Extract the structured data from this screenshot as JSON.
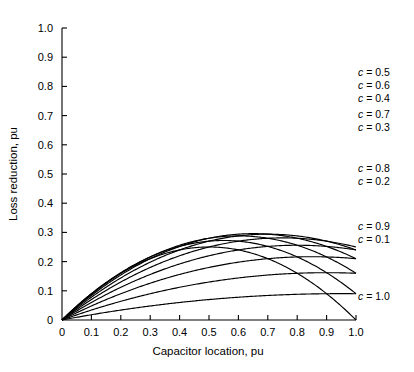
{
  "chart_data": {
    "type": "line",
    "title": "",
    "xlabel": "Capacitor location, pu",
    "ylabel": "Loss reduction, pu",
    "xlim": [
      0,
      1.0
    ],
    "ylim": [
      0,
      1.0
    ],
    "grid": false,
    "legend_position": "right-inline",
    "xticks": [
      "0",
      "0.1",
      "0.2",
      "0.3",
      "0.4",
      "0.5",
      "0.6",
      "0.7",
      "0.8",
      "0.9",
      "1.0"
    ],
    "xtick_values": [
      0,
      0.1,
      0.2,
      0.3,
      0.4,
      0.5,
      0.6,
      0.7,
      0.8,
      0.9,
      1.0
    ],
    "yticks": [
      "0",
      "0.1",
      "0.2",
      "0.3",
      "0.4",
      "0.5",
      "0.6",
      "0.7",
      "0.8",
      "0.9",
      "1.0"
    ],
    "ytick_values": [
      0,
      0.1,
      0.2,
      0.3,
      0.4,
      0.5,
      0.6,
      0.7,
      0.8,
      0.9,
      1.0
    ],
    "formula": "f(x) = c(2x - x^2) - c^2 x",
    "x": [
      0,
      0.05,
      0.1,
      0.15,
      0.2,
      0.25,
      0.3,
      0.35,
      0.4,
      0.45,
      0.5,
      0.55,
      0.6,
      0.65,
      0.7,
      0.75,
      0.8,
      0.85,
      0.9,
      0.95,
      1.0
    ],
    "series": [
      {
        "name": "c = 0.1",
        "c": 0.1,
        "peak_x": 0.95,
        "peak_y": 0.1,
        "end_y": 0.09,
        "values": [
          0,
          0.0094,
          0.0185,
          0.0273,
          0.0357,
          0.0438,
          0.0515,
          0.0589,
          0.066,
          0.0727,
          0.079,
          0.085,
          0.0906,
          0.0959,
          0.1008,
          0.1054,
          0.1096,
          0.1134,
          0.1169,
          0.1201,
          0.1229
        ]
      },
      {
        "name": "c = 0.2",
        "c": 0.2,
        "peak_x": 0.9,
        "peak_y": 0.2,
        "end_y": 0.16,
        "values": [
          0,
          0.0175,
          0.0345,
          0.051,
          0.067,
          0.0825,
          0.0975,
          0.112,
          0.126,
          0.1395,
          0.1525,
          0.165,
          0.177,
          0.1885,
          0.1995,
          0.21,
          0.22,
          0.2295,
          0.2385,
          0.247,
          0.255
        ]
      },
      {
        "name": "c = 0.3",
        "c": 0.3,
        "peak_x": 0.85,
        "peak_y": 0.3,
        "end_y": 0.21,
        "values": [
          0,
          0.0248,
          0.0489,
          0.0723,
          0.095,
          0.117,
          0.1383,
          0.1589,
          0.1788,
          0.198,
          0.2165,
          0.2343,
          0.2514,
          0.2678,
          0.2835,
          0.2985,
          0.3128,
          0.3264,
          0.3393,
          0.3515,
          0.363
        ]
      },
      {
        "name": "c = 0.4",
        "c": 0.4,
        "peak_x": 0.8,
        "peak_y": 0.4,
        "end_y": 0.24,
        "values": [
          0,
          0.0312,
          0.0616,
          0.0912,
          0.12,
          0.148,
          0.1752,
          0.2016,
          0.2272,
          0.252,
          0.276,
          0.2992,
          0.3216,
          0.3432,
          0.364,
          0.384,
          0.4032,
          0.4216,
          0.4392,
          0.456,
          0.472
        ]
      },
      {
        "name": "c = 0.5",
        "c": 0.5,
        "peak_x": 0.75,
        "peak_y": 0.5,
        "end_y": 0.25,
        "values": [
          0,
          0.0369,
          0.0725,
          0.1069,
          0.14,
          0.1719,
          0.2025,
          0.2319,
          0.26,
          0.2869,
          0.3125,
          0.3369,
          0.36,
          0.3819,
          0.4025,
          0.4219,
          0.44,
          0.4569,
          0.4725,
          0.4869,
          0.5
        ]
      },
      {
        "name": "c = 0.6",
        "c": 0.6,
        "peak_x": 0.7,
        "peak_y": 0.6,
        "end_y": 0.24,
        "values": [
          0,
          0.0417,
          0.0816,
          0.1197,
          0.156,
          0.1905,
          0.2232,
          0.2541,
          0.2832,
          0.3105,
          0.336,
          0.3597,
          0.3816,
          0.4017,
          0.42,
          0.4365,
          0.4512,
          0.4641,
          0.4752,
          0.4845,
          0.492
        ]
      },
      {
        "name": "c = 0.7",
        "c": 0.7,
        "peak_x": 0.65,
        "peak_y": 0.7,
        "end_y": 0.21,
        "values": [
          0,
          0.0456,
          0.0889,
          0.1298,
          0.168,
          0.2039,
          0.2373,
          0.2683,
          0.2968,
          0.3229,
          0.3465,
          0.3678,
          0.3866,
          0.403,
          0.417,
          0.4285,
          0.4376,
          0.4443,
          0.4486,
          0.4504,
          0.45
        ]
      },
      {
        "name": "c = 0.8",
        "c": 0.8,
        "peak_x": 0.6,
        "peak_y": 0.8,
        "end_y": 0.16,
        "values": [
          0,
          0.0484,
          0.0936,
          0.1356,
          0.176,
          0.212,
          0.2448,
          0.2744,
          0.3008,
          0.324,
          0.344,
          0.3608,
          0.3744,
          0.3848,
          0.392,
          0.396,
          0.3968,
          0.3944,
          0.3888,
          0.38,
          0.368
        ]
      },
      {
        "name": "c = 0.9",
        "c": 0.9,
        "peak_x": 0.55,
        "peak_y": 0.9,
        "end_y": 0.09,
        "values": [
          0,
          0.0473,
          0.0929,
          0.1337,
          0.172,
          0.2059,
          0.2363,
          0.2631,
          0.2864,
          0.3061,
          0.3225,
          0.3353,
          0.3446,
          0.3504,
          0.3528,
          0.3516,
          0.3469,
          0.3386,
          0.3269,
          0.3116,
          0.293
        ]
      },
      {
        "name": "c = 1.0",
        "c": 1.0,
        "peak_x": 0.5,
        "peak_y": 1.0,
        "end_y": 0.0,
        "values": [
          0,
          0.0475,
          0.09,
          0.1275,
          0.16,
          0.1875,
          0.21,
          0.2275,
          0.24,
          0.2475,
          0.25,
          0.2475,
          0.24,
          0.2275,
          0.21,
          0.1875,
          0.16,
          0.1275,
          0.09,
          0.0475,
          0.0
        ]
      }
    ],
    "annotations": [
      {
        "text": "c = 0.5",
        "c": 0.5,
        "x_px": 358,
        "y_px": 76
      },
      {
        "text": "c = 0.6",
        "c": 0.6,
        "x_px": 358,
        "y_px": 89
      },
      {
        "text": "c = 0.4",
        "c": 0.4,
        "x_px": 358,
        "y_px": 102
      },
      {
        "text": "c = 0.7",
        "c": 0.7,
        "x_px": 358,
        "y_px": 118
      },
      {
        "text": "c = 0.3",
        "c": 0.3,
        "x_px": 358,
        "y_px": 131
      },
      {
        "text": "c = 0.8",
        "c": 0.8,
        "x_px": 358,
        "y_px": 172
      },
      {
        "text": "c = 0.2",
        "c": 0.2,
        "x_px": 358,
        "y_px": 185
      },
      {
        "text": "c = 0.9",
        "c": 0.9,
        "x_px": 358,
        "y_px": 230
      },
      {
        "text": "c = 0.1",
        "c": 0.1,
        "x_px": 358,
        "y_px": 243
      },
      {
        "text": "c = 1.0",
        "c": 1.0,
        "x_px": 358,
        "y_px": 300
      }
    ]
  }
}
